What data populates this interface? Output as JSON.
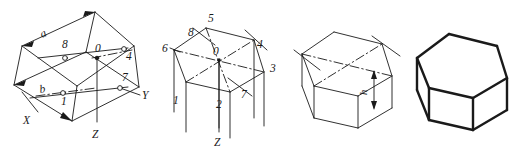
{
  "figure": {
    "panel_count": 4
  },
  "panels": [
    {
      "id": "step-1",
      "name": "axonometric-axes-and-base-rhombus",
      "description": "Isometric axes X, Y, Z with base construction rhombus of sides a and b",
      "axes": [
        {
          "name": "x-axis",
          "label": "X"
        },
        {
          "name": "y-axis",
          "label": "Y"
        },
        {
          "name": "z-axis",
          "label": "Z"
        }
      ],
      "dimensions": [
        {
          "name": "side-a",
          "label": "a"
        },
        {
          "name": "side-b",
          "label": "b"
        }
      ],
      "points": [
        {
          "label": "0",
          "role": "origin"
        },
        {
          "label": "8",
          "role": "marked-point"
        },
        {
          "label": "1",
          "role": "marked-point"
        },
        {
          "label": "4",
          "role": "marked-point"
        },
        {
          "label": "7",
          "role": "marked-point"
        }
      ]
    },
    {
      "id": "step-2",
      "name": "hexagon-top-face-with-vertical-edges",
      "description": "Hexagonal top face plotted from points 1-8 with vertical prism edges dropped",
      "axes": [
        {
          "name": "z-axis",
          "label": "Z"
        }
      ],
      "points": [
        {
          "label": "0",
          "role": "center"
        },
        {
          "label": "5",
          "role": "vertex"
        },
        {
          "label": "8",
          "role": "vertex"
        },
        {
          "label": "6",
          "role": "vertex"
        },
        {
          "label": "4",
          "role": "vertex"
        },
        {
          "label": "3",
          "role": "vertex"
        },
        {
          "label": "1",
          "role": "vertex"
        },
        {
          "label": "2",
          "role": "vertex"
        },
        {
          "label": "7",
          "role": "vertex"
        }
      ]
    },
    {
      "id": "step-3",
      "name": "prism-with-height-dimension",
      "description": "Prism body formed by trimming vertical edges to height h",
      "dimensions": [
        {
          "name": "height-h",
          "label": "h"
        }
      ],
      "points": []
    },
    {
      "id": "step-4",
      "name": "finished-hexagonal-prism",
      "description": "Completed hexagonal prism with construction lines removed and outlines thickened",
      "dimensions": [],
      "points": []
    }
  ],
  "style": {
    "line_color": "#1a1a1a",
    "background_color": "#ffffff",
    "thin_line_width": "0.9",
    "bold_line_width": "2.4"
  }
}
